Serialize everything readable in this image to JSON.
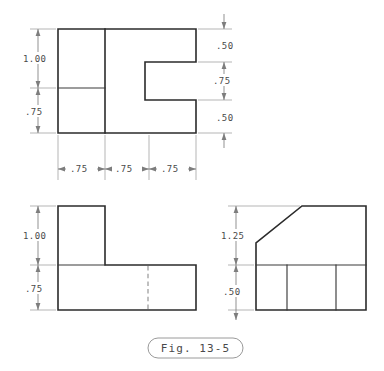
{
  "figure": {
    "caption": "Fig. 13-5",
    "background_color": "#ffffff",
    "object_line_color": "#2b2b2b",
    "hidden_line_color": "#8d8d8d",
    "dimension_line_color": "#7d7d7d",
    "extension_line_color": "#a8a8a8",
    "text_color": "#4a4a4a"
  },
  "views": {
    "top": {
      "name": "top-view",
      "vertical_dimensions_left": [
        {
          "label": "1.00"
        },
        {
          "label": ".75"
        }
      ],
      "vertical_dimensions_right": [
        {
          "label": ".50"
        },
        {
          "label": ".75"
        },
        {
          "label": ".50"
        }
      ],
      "horizontal_dimensions_bottom": [
        {
          "label": ".75"
        },
        {
          "label": ".75"
        },
        {
          "label": ".75"
        }
      ]
    },
    "front": {
      "name": "front-view",
      "vertical_dimensions_left": [
        {
          "label": "1.00"
        },
        {
          "label": ".75"
        }
      ]
    },
    "side": {
      "name": "side-view",
      "vertical_dimensions_left": [
        {
          "label": "1.25"
        },
        {
          "label": ".50"
        }
      ]
    }
  }
}
